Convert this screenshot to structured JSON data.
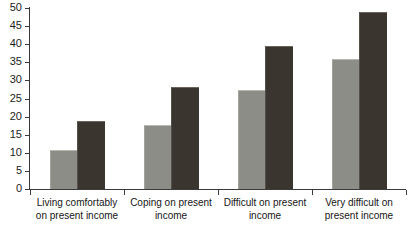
{
  "chart_data": {
    "type": "bar",
    "title": "",
    "subtitle": "",
    "xlabel": "",
    "ylabel": "",
    "ylim": [
      0,
      50
    ],
    "yticks": [
      0,
      5,
      10,
      15,
      20,
      25,
      30,
      35,
      40,
      45,
      50
    ],
    "grid": false,
    "legend": "none",
    "categories": [
      "Living comfortably on present income",
      "Coping on present income",
      "Difficult on present income",
      "Very difficult on present income"
    ],
    "category_lines": [
      [
        "Living comfortably",
        "on present income"
      ],
      [
        "Coping on present",
        "income"
      ],
      [
        "Difficult on present",
        "income"
      ],
      [
        "Very difficult on",
        "present income"
      ]
    ],
    "series": [
      {
        "name": "series-1",
        "color": "#8d8d87",
        "values": [
          10.5,
          17.3,
          27.0,
          35.7
        ]
      },
      {
        "name": "series-2",
        "color": "#3b352f",
        "values": [
          18.4,
          27.9,
          39.1,
          48.5
        ]
      }
    ]
  },
  "axis": {
    "y_tick_labels": [
      "0",
      "5",
      "10",
      "15",
      "20",
      "25",
      "30",
      "35",
      "40",
      "45",
      "50"
    ]
  },
  "colors": {
    "light_bar": "#8d8d87",
    "dark_bar": "#3b352f",
    "axis": "#3a3a3a",
    "background": "#ffffff"
  }
}
